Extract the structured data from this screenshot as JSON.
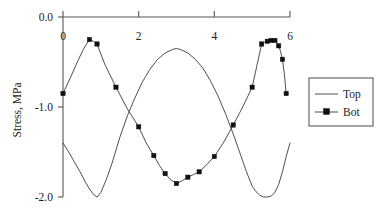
{
  "chart_data": {
    "type": "line",
    "title": "",
    "xlabel": "",
    "ylabel": "Stress, MPa",
    "xlim": [
      0,
      6
    ],
    "ylim": [
      -2.0,
      0.0
    ],
    "grid": false,
    "x_axis_position": "top",
    "legend_position": "right",
    "x_ticks": [
      0,
      2,
      4,
      6
    ],
    "x_tick_labels": [
      "0",
      "2",
      "4",
      "6"
    ],
    "y_ticks": [
      0.0,
      -1.0,
      -2.0
    ],
    "y_tick_labels": [
      "0.0",
      "-1.0",
      "-2.0"
    ],
    "legend": [
      "Top",
      "Bot"
    ],
    "series": [
      {
        "name": "Top",
        "marker": "none",
        "x": [
          0.0,
          0.15,
          0.3,
          0.45,
          0.6,
          0.7,
          0.8,
          0.9,
          1.0,
          1.15,
          1.3,
          1.5,
          1.7,
          1.9,
          2.1,
          2.3,
          2.5,
          2.7,
          2.9,
          3.0,
          3.1,
          3.3,
          3.5,
          3.7,
          3.9,
          4.1,
          4.3,
          4.5,
          4.7,
          4.85,
          5.0,
          5.1,
          5.2,
          5.3,
          5.4,
          5.5,
          5.6,
          5.7,
          5.8,
          5.9,
          6.0
        ],
        "values": [
          -1.4,
          -1.5,
          -1.61,
          -1.72,
          -1.84,
          -1.91,
          -1.97,
          -2.0,
          -1.95,
          -1.8,
          -1.62,
          -1.34,
          -1.1,
          -0.9,
          -0.72,
          -0.58,
          -0.47,
          -0.4,
          -0.36,
          -0.35,
          -0.36,
          -0.4,
          -0.47,
          -0.57,
          -0.71,
          -0.88,
          -1.08,
          -1.3,
          -1.54,
          -1.72,
          -1.88,
          -1.94,
          -1.98,
          -2.0,
          -2.0,
          -1.99,
          -1.95,
          -1.86,
          -1.72,
          -1.55,
          -1.4
        ]
      },
      {
        "name": "Bot",
        "marker": "square",
        "x": [
          0.0,
          0.7,
          0.9,
          1.4,
          2.0,
          2.4,
          2.7,
          3.0,
          3.3,
          3.6,
          4.0,
          4.5,
          5.0,
          5.25,
          5.4,
          5.5,
          5.6,
          5.7,
          5.8,
          5.9
        ],
        "values": [
          -0.85,
          -0.25,
          -0.3,
          -0.78,
          -1.22,
          -1.54,
          -1.74,
          -1.85,
          -1.78,
          -1.72,
          -1.55,
          -1.2,
          -0.78,
          -0.3,
          -0.27,
          -0.26,
          -0.26,
          -0.32,
          -0.47,
          -0.85
        ],
        "interp_x": [
          0.0,
          0.2,
          0.4,
          0.55,
          0.7,
          0.8,
          0.9,
          1.1,
          1.4,
          1.7,
          2.0,
          2.2,
          2.4,
          2.55,
          2.7,
          2.85,
          3.0,
          3.15,
          3.3,
          3.45,
          3.6,
          3.8,
          4.0,
          4.25,
          4.5,
          4.75,
          5.0,
          5.12,
          5.25,
          5.33,
          5.4,
          5.45,
          5.5,
          5.55,
          5.6,
          5.65,
          5.7,
          5.75,
          5.8,
          5.85,
          5.9
        ],
        "interp_values": [
          -0.85,
          -0.67,
          -0.48,
          -0.35,
          -0.25,
          -0.27,
          -0.3,
          -0.52,
          -0.78,
          -1.02,
          -1.22,
          -1.4,
          -1.54,
          -1.65,
          -1.74,
          -1.81,
          -1.85,
          -1.82,
          -1.78,
          -1.75,
          -1.72,
          -1.64,
          -1.55,
          -1.39,
          -1.2,
          -1.0,
          -0.78,
          -0.55,
          -0.3,
          -0.28,
          -0.27,
          -0.265,
          -0.26,
          -0.255,
          -0.26,
          -0.28,
          -0.32,
          -0.38,
          -0.47,
          -0.63,
          -0.85
        ]
      }
    ]
  },
  "legend": {
    "items": [
      {
        "label": "Top"
      },
      {
        "label": "Bot"
      }
    ]
  },
  "axes": {
    "ylabel": "Stress, MPa",
    "y_tick_labels": [
      "0.0",
      "-1.0",
      "-2.0"
    ],
    "x_tick_labels": [
      "0",
      "2",
      "4",
      "6"
    ]
  }
}
